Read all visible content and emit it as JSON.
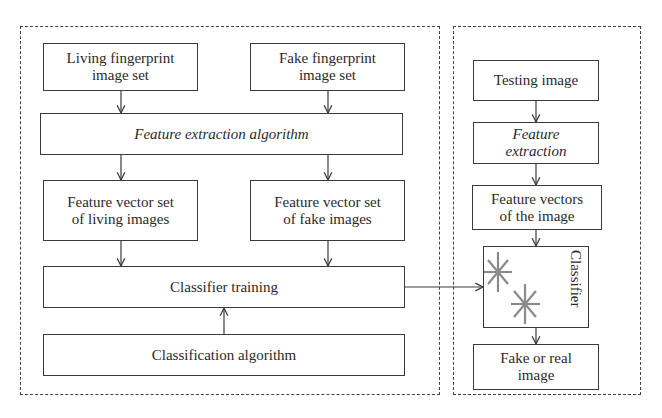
{
  "training_panel": {
    "living_set": [
      "Living fingerprint",
      "image set"
    ],
    "fake_set": [
      "Fake fingerprint",
      "image set"
    ],
    "feature_extraction": "Feature extraction algorithm",
    "living_vectors": [
      "Feature vector set",
      "of living images"
    ],
    "fake_vectors": [
      "Feature vector set",
      "of fake images"
    ],
    "classifier_training": "Classifier training",
    "classification_algorithm": "Classification algorithm"
  },
  "testing_panel": {
    "testing_image": "Testing image",
    "feature_extraction": [
      "Feature",
      "extraction"
    ],
    "feature_vectors": [
      "Feature vectors",
      "of the image"
    ],
    "classifier": "Classifier",
    "classifier_icon": "asterisk-markers",
    "output": [
      "Fake or real",
      "image"
    ]
  },
  "colors": {
    "line": "#3a3a3a",
    "marker": "#8a8a8a"
  }
}
